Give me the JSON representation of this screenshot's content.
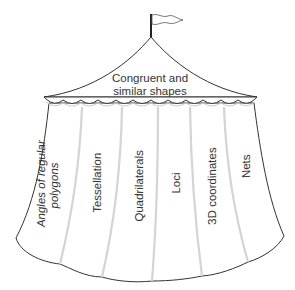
{
  "diagram": {
    "type": "tent-concept-map",
    "roof": {
      "line1": "Congruent and",
      "line2": "similar shapes"
    },
    "panels": [
      {
        "line1": "Angles of regular",
        "line2": "polygons"
      },
      {
        "line1": "Tessellation",
        "line2": ""
      },
      {
        "line1": "Quadrilaterals",
        "line2": ""
      },
      {
        "line1": "Loci",
        "line2": ""
      },
      {
        "line1": "3D coordinates",
        "line2": ""
      },
      {
        "line1": "Nets",
        "line2": ""
      }
    ],
    "colors": {
      "outline": "#333333",
      "fill": "#ffffff",
      "fold_shadow": "#d8d8d8",
      "text": "#333333"
    }
  }
}
